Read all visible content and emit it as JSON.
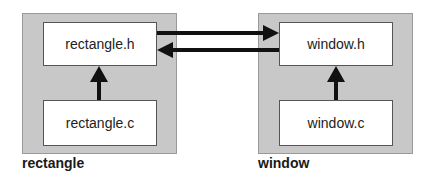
{
  "modules": [
    {
      "name": "rectangle",
      "label": "rectangle",
      "header": "rectangle.h",
      "source": "rectangle.c"
    },
    {
      "name": "window",
      "label": "window",
      "header": "window.h",
      "source": "window.c"
    }
  ],
  "edges": [
    {
      "from": "rectangle.c",
      "to": "rectangle.h"
    },
    {
      "from": "window.c",
      "to": "window.h"
    },
    {
      "from": "rectangle.h",
      "to": "window.h"
    },
    {
      "from": "window.h",
      "to": "rectangle.h"
    }
  ],
  "colors": {
    "module_bg": "#c8c8c8",
    "file_bg": "#ffffff",
    "arrow": "#111111"
  }
}
